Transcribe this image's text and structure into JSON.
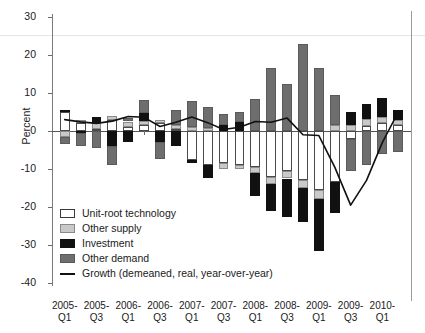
{
  "chart_data": {
    "type": "bar",
    "subtype": "stacked-bar-with-line",
    "title": "",
    "xlabel": "",
    "ylabel": "Percent",
    "ylim": [
      -40,
      30
    ],
    "yticks": [
      30,
      20,
      10,
      0,
      -10,
      -20,
      -30,
      -40
    ],
    "grid": false,
    "legend_position": "inside-lower-left",
    "categories": [
      "2005-Q1",
      "2005-Q2",
      "2005-Q3",
      "2005-Q4",
      "2006-Q1",
      "2006-Q2",
      "2006-Q3",
      "2006-Q4",
      "2007-Q1",
      "2007-Q2",
      "2007-Q3",
      "2007-Q4",
      "2008-Q1",
      "2008-Q2",
      "2008-Q3",
      "2008-Q4",
      "2009-Q1",
      "2009-Q2",
      "2009-Q3",
      "2009-Q4",
      "2010-Q1",
      "2010-Q2"
    ],
    "xtick_labels": [
      "2005-Q1",
      "2005-Q3",
      "2006-Q1",
      "2006-Q3",
      "2007-Q1",
      "2007-Q3",
      "2008-Q1",
      "2008-Q3",
      "2009-Q1",
      "2009-Q3",
      "2010-Q1"
    ],
    "series": [
      {
        "name": "Unit-root technology",
        "color": "#ffffff",
        "values": [
          5.0,
          2.0,
          0.6,
          3.0,
          1.0,
          1.5,
          2.2,
          0.5,
          -7.5,
          -9.0,
          -8.5,
          -9.0,
          -9.5,
          -12.0,
          -10.5,
          -13.0,
          -15.5,
          -13.5,
          -2.0,
          1.2,
          2.0,
          1.5
        ]
      },
      {
        "name": "Other supply",
        "color": "#c9c9c9",
        "values": [
          -1.5,
          1.0,
          1.5,
          1.0,
          1.5,
          1.2,
          0.8,
          1.0,
          1.0,
          0.8,
          -1.5,
          -1.0,
          -1.5,
          -2.0,
          -2.0,
          -2.0,
          -2.5,
          1.5,
          1.6,
          2.0,
          1.8,
          1.5
        ]
      },
      {
        "name": "Investment",
        "color": "#111111",
        "values": [
          0.4,
          -0.5,
          1.5,
          -4.0,
          -3.0,
          2.0,
          -3.0,
          -4.0,
          -1.0,
          -3.5,
          1.5,
          2.5,
          -6.0,
          -7.0,
          -10.0,
          -9.0,
          -13.5,
          -8.0,
          3.5,
          4.0,
          5.0,
          2.5
        ]
      },
      {
        "name": "Other demand",
        "color": "#6e6e6e",
        "values": [
          -2.0,
          -3.5,
          -4.5,
          -5.0,
          1.0,
          3.5,
          -4.5,
          4.0,
          7.0,
          5.5,
          3.0,
          2.5,
          8.5,
          16.5,
          12.5,
          23.0,
          16.5,
          8.0,
          -8.5,
          -9.0,
          -6.0,
          -5.5
        ]
      }
    ],
    "line_series": {
      "name": "Growth (demeaned, real, year-over-year)",
      "color": "#111111",
      "values": [
        3.0,
        2.4,
        2.0,
        2.6,
        3.8,
        3.6,
        1.2,
        2.3,
        3.7,
        2.2,
        0.4,
        1.0,
        2.5,
        2.3,
        3.4,
        -1.0,
        -1.2,
        -9.5,
        -19.5,
        -13.0,
        -3.0,
        5.0
      ]
    }
  },
  "axis": {
    "ylabel": "Percent",
    "yticks": [
      "30",
      "20",
      "10",
      "0",
      "-10",
      "-20",
      "-30",
      "-40"
    ]
  },
  "legend": {
    "items": [
      {
        "label": "Unit-root technology",
        "swatch": "unit"
      },
      {
        "label": "Other supply",
        "swatch": "supply"
      },
      {
        "label": "Investment",
        "swatch": "invest"
      },
      {
        "label": "Other demand",
        "swatch": "demand"
      },
      {
        "label": "Growth (demeaned, real, year-over-year)",
        "swatch": "line"
      }
    ]
  },
  "xlabels": [
    {
      "line1": "2005-",
      "line2": "Q1"
    },
    {
      "line1": "2005-",
      "line2": "Q3"
    },
    {
      "line1": "2006-",
      "line2": "Q1"
    },
    {
      "line1": "2006-",
      "line2": "Q3"
    },
    {
      "line1": "2007-",
      "line2": "Q1"
    },
    {
      "line1": "2007-",
      "line2": "Q3"
    },
    {
      "line1": "2008-",
      "line2": "Q1"
    },
    {
      "line1": "2008-",
      "line2": "Q3"
    },
    {
      "line1": "2009-",
      "line2": "Q1"
    },
    {
      "line1": "2009-",
      "line2": "Q3"
    },
    {
      "line1": "2010-",
      "line2": "Q1"
    }
  ]
}
